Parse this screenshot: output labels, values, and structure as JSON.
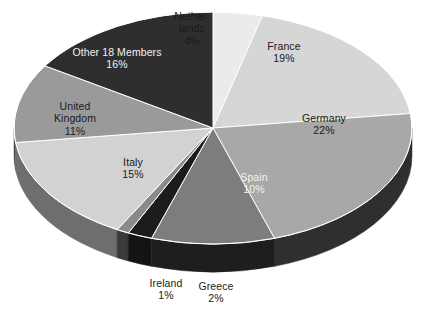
{
  "chart_data": {
    "type": "pie",
    "title": "",
    "subtitle": "",
    "xlabel": "",
    "ylabel": "",
    "legend_position": "none",
    "grid": false,
    "three_d": true,
    "value_unit": "%",
    "start_angle_deg": 0,
    "direction": "clockwise",
    "categories": [
      "Netherlands",
      "France",
      "Germany",
      "Spain",
      "Greece",
      "Ireland",
      "Italy",
      "United Kingdom",
      "Other 18 Members"
    ],
    "values": [
      4,
      19,
      22,
      10,
      2,
      1,
      15,
      11,
      16
    ],
    "labels": [
      "Netherlands 4%",
      "France 19%",
      "Germany 22%",
      "Spain 10%",
      "Greece 2%",
      "Ireland 1%",
      "Italy 15%",
      "United Kingdom 11%",
      "Other 18 Members 16%"
    ],
    "colors": [
      "#ebebeb",
      "#d6d6d6",
      "#a8a8a8",
      "#7d7d7d",
      "#1c1c1c",
      "#8a8a8a",
      "#d2d2d2",
      "#9a9a9a",
      "#2e2e2e"
    ],
    "total": 100
  },
  "slices": [
    {
      "name": "Netherlands",
      "name_line1": "Nether-",
      "name_line2": "lands",
      "value_text": "4%",
      "value": 4,
      "color": "#ebebeb",
      "side_color": "#bdbdbd",
      "label_color": "dark"
    },
    {
      "name": "France",
      "name_line1": "France",
      "name_line2": "",
      "value_text": "19%",
      "value": 19,
      "color": "#d6d6d6",
      "side_color": "#a9a9a9",
      "label_color": "dark"
    },
    {
      "name": "Germany",
      "name_line1": "Germany",
      "name_line2": "",
      "value_text": "22%",
      "value": 22,
      "color": "#a8a8a8",
      "side_color": "#2f2f2f",
      "label_color": "dark"
    },
    {
      "name": "Spain",
      "name_line1": "Spain",
      "name_line2": "",
      "value_text": "10%",
      "value": 10,
      "color": "#7d7d7d",
      "side_color": "#1e1e1e",
      "label_color": "light"
    },
    {
      "name": "Greece",
      "name_line1": "Greece",
      "name_line2": "",
      "value_text": "2%",
      "value": 2,
      "color": "#1c1c1c",
      "side_color": "#141414",
      "label_color": "dark"
    },
    {
      "name": "Ireland",
      "name_line1": "Ireland",
      "name_line2": "",
      "value_text": "1%",
      "value": 1,
      "color": "#8a8a8a",
      "side_color": "#3a3a3a",
      "label_color": "dark"
    },
    {
      "name": "Italy",
      "name_line1": "Italy",
      "name_line2": "",
      "value_text": "15%",
      "value": 15,
      "color": "#d2d2d2",
      "side_color": "#6e6e6e",
      "label_color": "dark"
    },
    {
      "name": "United Kingdom",
      "name_line1": "United",
      "name_line2": "Kingdom",
      "value_text": "11%",
      "value": 11,
      "color": "#9a9a9a",
      "side_color": "#4a4a4a",
      "label_color": "dark"
    },
    {
      "name": "Other 18 Members",
      "name_line1": "Other 18 Members",
      "name_line2": "",
      "value_text": "16%",
      "value": 16,
      "color": "#2e2e2e",
      "side_color": "#1a1a1a",
      "label_color": "light"
    }
  ]
}
